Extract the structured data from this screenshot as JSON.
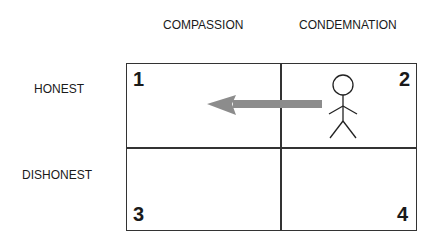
{
  "columns": [
    "COMPASSION",
    "CONDEMNATION"
  ],
  "rows": [
    "HONEST",
    "DISHONEST"
  ],
  "quadrants": [
    "1",
    "2",
    "3",
    "4"
  ],
  "figure": {
    "label": "stick-figure",
    "location": "quadrant 2"
  },
  "arrow": {
    "from": "quadrant 2",
    "to": "quadrant 1",
    "color": "#8c8c8c"
  }
}
